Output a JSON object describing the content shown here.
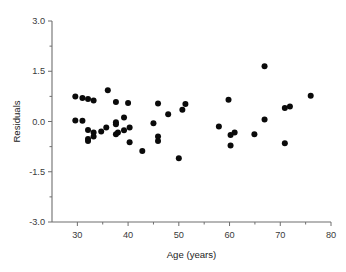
{
  "chart_data": {
    "type": "scatter",
    "title": "",
    "xlabel": "Age (years)",
    "ylabel": "Residuals",
    "xlim": [
      25,
      80
    ],
    "ylim": [
      -3.0,
      3.0
    ],
    "grid": false,
    "legend": null,
    "xticks": [
      30,
      40,
      50,
      60,
      70,
      80
    ],
    "xtick_labels": [
      "30",
      "40",
      "50",
      "60",
      "70",
      "80"
    ],
    "x_minor_ticks": [
      35,
      45,
      55,
      65,
      75
    ],
    "yticks": [
      -3.0,
      -1.5,
      0.0,
      1.5,
      3.0
    ],
    "ytick_labels": [
      "-3.0",
      "-1.5",
      "0.0",
      "1.5",
      "3.0"
    ],
    "y_minor_ticks": [
      -2.25,
      -0.75,
      0.75,
      2.25
    ],
    "marker": "filled-circle",
    "marker_color": "#0a0a0a",
    "marker_size": 3.0,
    "x": [
      29.6,
      29.6,
      31.0,
      32.1,
      32.1,
      33.2,
      33.2,
      31.0,
      32.1,
      32.1,
      32.1,
      33.2,
      35.7,
      34.7,
      36.0,
      37.6,
      37.6,
      37.6,
      38.0,
      39.2,
      39.2,
      40.0,
      40.3,
      40.3,
      42.8,
      45.0,
      45.9,
      45.9,
      45.9,
      47.9,
      50.7,
      50.0,
      51.3,
      57.9,
      59.8,
      60.2,
      60.2,
      61.0,
      64.9,
      66.9,
      66.9,
      70.9,
      70.9,
      71.9,
      76.0
    ],
    "y": [
      0.75,
      0.03,
      0.7,
      0.67,
      0.63,
      0.02,
      -0.33,
      -0.25,
      -0.52,
      -0.58,
      -0.3,
      -0.45,
      -0.18,
      0.93,
      0.58,
      -0.02,
      -0.08,
      -0.38,
      0.12,
      -0.26,
      -0.33,
      0.55,
      -0.18,
      -0.62,
      -0.88,
      -0.05,
      0.54,
      -0.45,
      -0.58,
      0.22,
      0.35,
      -1.1,
      0.52,
      -0.15,
      0.65,
      -0.4,
      -0.33,
      -0.72,
      -0.38,
      1.65,
      0.06,
      0.4,
      -0.65,
      0.45,
      0.77
    ],
    "points": [
      {
        "age": 29.6,
        "residual": 0.75
      },
      {
        "age": 29.6,
        "residual": 0.03
      },
      {
        "age": 31.0,
        "residual": 0.7
      },
      {
        "age": 32.1,
        "residual": 0.67
      },
      {
        "age": 33.2,
        "residual": 0.63
      },
      {
        "age": 31.0,
        "residual": 0.02
      },
      {
        "age": 32.1,
        "residual": -0.25
      },
      {
        "age": 32.1,
        "residual": -0.52
      },
      {
        "age": 32.1,
        "residual": -0.58
      },
      {
        "age": 33.2,
        "residual": -0.33
      },
      {
        "age": 33.2,
        "residual": -0.45
      },
      {
        "age": 34.7,
        "residual": -0.3
      },
      {
        "age": 35.7,
        "residual": -0.18
      },
      {
        "age": 36.0,
        "residual": 0.93
      },
      {
        "age": 37.6,
        "residual": 0.58
      },
      {
        "age": 37.6,
        "residual": -0.02
      },
      {
        "age": 37.6,
        "residual": -0.08
      },
      {
        "age": 37.6,
        "residual": -0.38
      },
      {
        "age": 38.0,
        "residual": -0.33
      },
      {
        "age": 39.2,
        "residual": -0.26
      },
      {
        "age": 39.2,
        "residual": 0.12
      },
      {
        "age": 40.0,
        "residual": 0.55
      },
      {
        "age": 40.3,
        "residual": -0.18
      },
      {
        "age": 40.3,
        "residual": -0.62
      },
      {
        "age": 42.8,
        "residual": -0.88
      },
      {
        "age": 45.0,
        "residual": -0.05
      },
      {
        "age": 45.9,
        "residual": 0.54
      },
      {
        "age": 45.9,
        "residual": -0.45
      },
      {
        "age": 45.9,
        "residual": -0.58
      },
      {
        "age": 47.9,
        "residual": 0.22
      },
      {
        "age": 50.0,
        "residual": -1.1
      },
      {
        "age": 50.7,
        "residual": 0.35
      },
      {
        "age": 51.3,
        "residual": 0.52
      },
      {
        "age": 57.9,
        "residual": -0.15
      },
      {
        "age": 59.8,
        "residual": 0.65
      },
      {
        "age": 60.2,
        "residual": -0.4
      },
      {
        "age": 60.2,
        "residual": -0.72
      },
      {
        "age": 61.0,
        "residual": -0.33
      },
      {
        "age": 64.9,
        "residual": -0.38
      },
      {
        "age": 66.9,
        "residual": 1.65
      },
      {
        "age": 66.9,
        "residual": 0.06
      },
      {
        "age": 70.9,
        "residual": 0.4
      },
      {
        "age": 70.9,
        "residual": -0.65
      },
      {
        "age": 71.9,
        "residual": 0.45
      },
      {
        "age": 76.0,
        "residual": 0.77
      }
    ]
  },
  "layout": {
    "plot_left_px": 52,
    "plot_right_px": 331,
    "plot_top_px": 21,
    "plot_bottom_px": 222,
    "x_axis_data_min": 25,
    "x_axis_data_max": 80,
    "y_axis_data_min": -3.0,
    "y_axis_data_max": 3.0
  }
}
